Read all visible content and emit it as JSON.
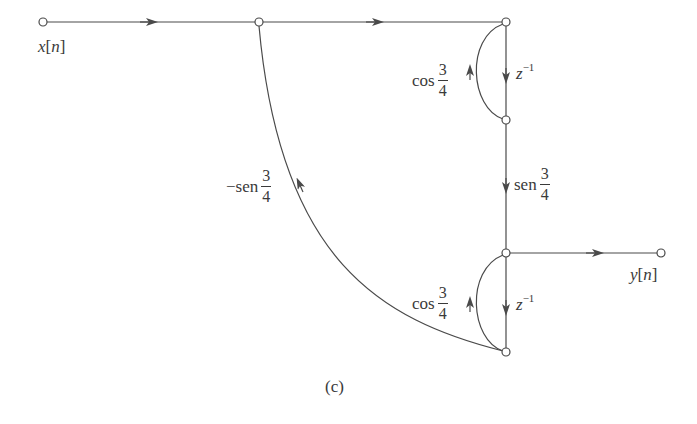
{
  "diagram": {
    "type": "signal-flow-graph",
    "caption": "(c)",
    "input_label": {
      "var": "x",
      "index": "n"
    },
    "output_label": {
      "var": "y",
      "index": "n"
    },
    "colors": {
      "line": "#4a4a4a",
      "text": "#3a3a3a",
      "background": "#ffffff"
    },
    "nodes": [
      {
        "id": "n_in",
        "x": 43,
        "y": 22
      },
      {
        "id": "n_split",
        "x": 259,
        "y": 22
      },
      {
        "id": "n_top",
        "x": 506,
        "y": 22
      },
      {
        "id": "n_mid",
        "x": 506,
        "y": 120
      },
      {
        "id": "n_out",
        "x": 506,
        "y": 253
      },
      {
        "id": "n_bot",
        "x": 506,
        "y": 352
      },
      {
        "id": "n_y",
        "x": 661,
        "y": 253
      }
    ],
    "branches": [
      {
        "from": "n_in",
        "to": "n_split",
        "gain": "1"
      },
      {
        "from": "n_split",
        "to": "n_top",
        "gain": "1"
      },
      {
        "from": "n_top",
        "to": "n_mid",
        "gain": "z^-1"
      },
      {
        "from": "n_mid",
        "to": "n_top",
        "gain": "cos 3/4"
      },
      {
        "from": "n_mid",
        "to": "n_out",
        "gain": "sen 3/4"
      },
      {
        "from": "n_out",
        "to": "n_bot",
        "gain": "z^-1"
      },
      {
        "from": "n_bot",
        "to": "n_out",
        "gain": "cos 3/4"
      },
      {
        "from": "n_bot",
        "to": "n_split",
        "gain": "-sen 3/4"
      },
      {
        "from": "n_out",
        "to": "n_y",
        "gain": "1"
      }
    ],
    "labels": {
      "cos_top": {
        "fn": "cos",
        "num": "3",
        "den": "4"
      },
      "z_top": {
        "base": "z",
        "exp": "−1"
      },
      "sen_mid": {
        "fn": "sen",
        "num": "3",
        "den": "4"
      },
      "neg_sen": {
        "fn": "−sen",
        "num": "3",
        "den": "4"
      },
      "cos_bot": {
        "fn": "cos",
        "num": "3",
        "den": "4"
      },
      "z_bot": {
        "base": "z",
        "exp": "−1"
      }
    }
  }
}
